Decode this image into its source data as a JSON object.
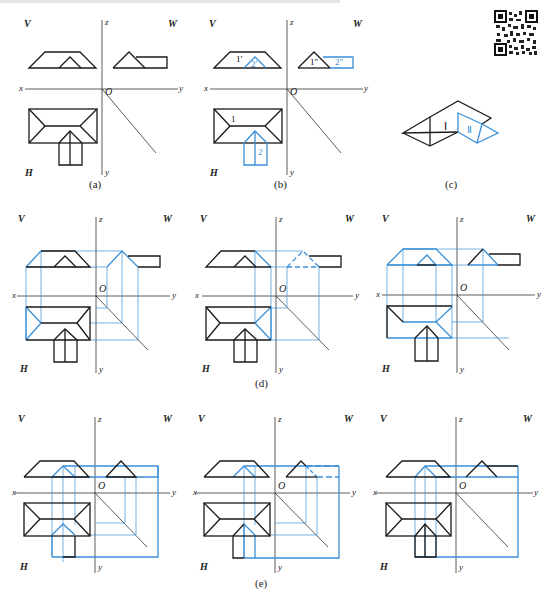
{
  "figure": {
    "header_text": "",
    "colors": {
      "line": "#1a1a1a",
      "construction": "#3a8fd6",
      "axis": "#333333"
    },
    "qr_code": "qr-code-icon",
    "panels": [
      {
        "id": "a",
        "caption": "(a)",
        "labels": {
          "V": "V",
          "W": "W",
          "H": "H",
          "x": "x",
          "y": "y",
          "z": "z",
          "yh": "y",
          "O": "O"
        }
      },
      {
        "id": "b",
        "caption": "(b)",
        "labels": {
          "V": "V",
          "W": "W",
          "H": "H",
          "x": "x",
          "y": "y",
          "z": "z",
          "yh": "y",
          "O": "O"
        },
        "annotations": {
          "front_1": "1′",
          "front_2": "2′",
          "side_1": "1″",
          "side_2": "2″",
          "top_1": "1",
          "top_2": "2"
        }
      },
      {
        "id": "c",
        "caption": "(c)",
        "annotations": {
          "part_1": "Ⅰ",
          "part_2": "Ⅱ"
        }
      },
      {
        "id": "d1",
        "caption": "",
        "labels": {
          "V": "V",
          "W": "W",
          "H": "H",
          "x": "x",
          "y": "y",
          "z": "z",
          "yh": "y",
          "O": "O"
        }
      },
      {
        "id": "d2",
        "caption": "(d)",
        "labels": {
          "V": "V",
          "W": "W",
          "H": "H",
          "x": "x",
          "y": "y",
          "z": "z",
          "yh": "y",
          "O": "O"
        }
      },
      {
        "id": "d3",
        "caption": "",
        "labels": {
          "V": "V",
          "W": "W",
          "H": "H",
          "x": "x",
          "y": "y",
          "z": "z",
          "yh": "y",
          "O": "O"
        }
      },
      {
        "id": "e1",
        "caption": "",
        "labels": {
          "V": "V",
          "W": "W",
          "H": "H",
          "x": "x",
          "y": "y",
          "z": "z",
          "yh": "y",
          "O": "O"
        }
      },
      {
        "id": "e2",
        "caption": "(e)",
        "labels": {
          "V": "V",
          "W": "W",
          "H": "H",
          "x": "x",
          "y": "y",
          "z": "z",
          "yh": "y",
          "O": "O"
        }
      },
      {
        "id": "e3",
        "caption": "",
        "labels": {
          "V": "V",
          "W": "W",
          "H": "H",
          "x": "x",
          "y": "y",
          "z": "z",
          "yh": "y",
          "O": "O"
        }
      }
    ]
  }
}
